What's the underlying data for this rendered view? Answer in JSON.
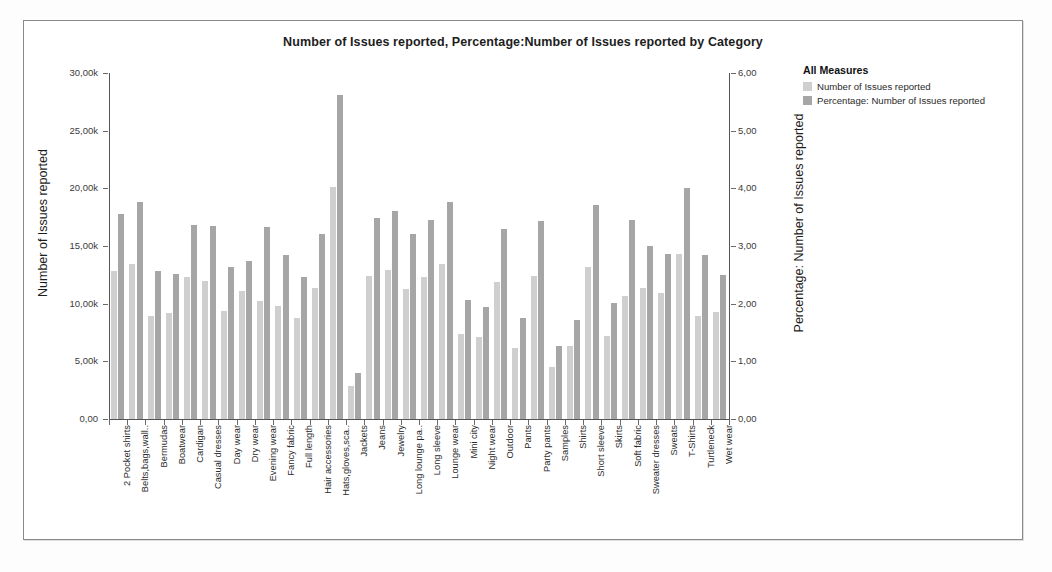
{
  "chart_data": {
    "type": "bar",
    "title": "Number of Issues reported, Percentage:Number of Issues reported by Category",
    "xlabel": "",
    "ylabel": "Number of Issues reported",
    "y2label": "Percentage: Number of Issues reported",
    "ylim": [
      0,
      30000
    ],
    "y2lim": [
      0,
      6
    ],
    "yticks": [
      "0,00",
      "5,00k",
      "10,00k",
      "15,00k",
      "20,00k",
      "25,00k",
      "30,00k"
    ],
    "y2ticks": [
      "0,00",
      "1,00",
      "2,00",
      "3,00",
      "4,00",
      "5,00",
      "6,00"
    ],
    "grid": false,
    "legend_position": "right",
    "legend_title": "All Measures",
    "categories": [
      "2 Pocket shirts",
      "Belts,bags,wall..",
      "Bermudas",
      "Boatwear",
      "Cardigan",
      "Casual dresses",
      "Day wear",
      "Dry wear",
      "Evening wear",
      "Fancy fabric",
      "Full length",
      "Hair accessories",
      "Hats,gloves,sca..",
      "Jackets",
      "Jeans",
      "Jewelry",
      "Long lounge pa..",
      "Long sleeve",
      "Lounge wear",
      "Mini city",
      "Night wear",
      "Outdoor",
      "Pants",
      "Party pants",
      "Samples",
      "Shirts",
      "Short sleeve",
      "Skirts",
      "Soft fabric",
      "Sweater dresses",
      "Sweats",
      "T-Shirts",
      "Turtleneck",
      "Wet wear"
    ],
    "series": [
      {
        "name": "Number of Issues reported",
        "color": "#cfcfcf",
        "axis": "left",
        "values": [
          12800,
          13400,
          8900,
          9200,
          12300,
          12000,
          9400,
          11100,
          10200,
          9800,
          8800,
          11400,
          20100,
          2900,
          12400,
          12900,
          11300,
          12300,
          13400,
          7400,
          7100,
          11900,
          6200,
          12400,
          4500,
          6300,
          13200,
          7200,
          10700,
          11400,
          10900,
          14300,
          8900,
          9300
        ]
      },
      {
        "name": "Percentage: Number of Issues reported",
        "color": "#a6a6a6",
        "axis": "right",
        "values": [
          3.55,
          3.77,
          2.57,
          2.51,
          3.36,
          3.34,
          2.64,
          2.74,
          3.33,
          2.85,
          2.47,
          3.2,
          5.62,
          0.8,
          3.48,
          3.61,
          3.21,
          3.45,
          3.77,
          2.06,
          1.94,
          3.3,
          1.76,
          3.44,
          1.26,
          1.72,
          3.71,
          2.02,
          3.45,
          3.0,
          2.87,
          4.0,
          2.84,
          2.5
        ]
      }
    ]
  }
}
